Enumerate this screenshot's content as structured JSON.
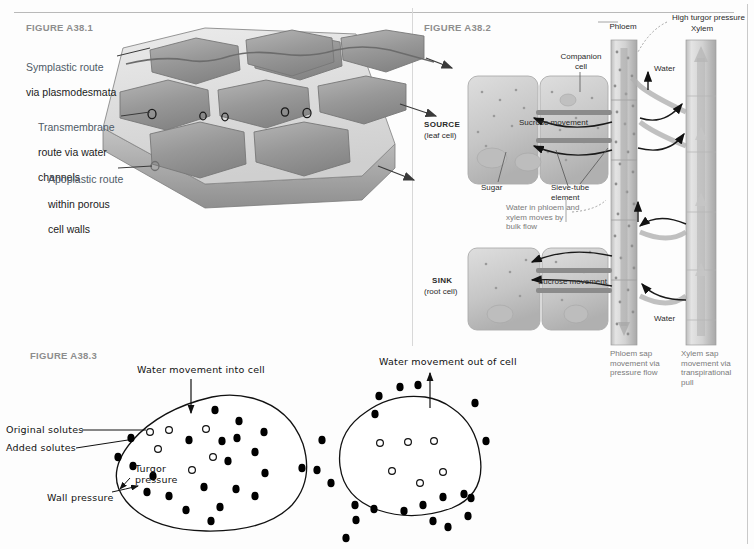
{
  "page": {
    "width": 754,
    "height": 549,
    "background": "#fdfdfd",
    "rule_color": "#b9b9b9"
  },
  "figures": {
    "fig1": {
      "label": "FIGURE A38.1",
      "topic": "Routes of water movement through plant cells",
      "callouts": [
        {
          "line1": "Symplastic route",
          "line2": "via plasmodesmata"
        },
        {
          "line1": "Transmembrane",
          "line2": "route via water",
          "line3": "channels"
        },
        {
          "line1": "Apoplastic route",
          "line2": "within porous",
          "line3": "cell walls"
        }
      ],
      "water_channel_count": 5,
      "arrow_count": 3,
      "colors": {
        "cell_fill": "#9b9b9b",
        "wall_fill": "#d8d8d8",
        "outline": "#6f6f6f"
      }
    },
    "fig2": {
      "label": "FIGURE A38.2",
      "topic": "Pressure-flow model of phloem transport",
      "labels": {
        "phloem": "Phloem",
        "xylem": "Xylem",
        "high_turgor": "High turgor pressure",
        "companion_cell": "Companion\ncell",
        "source_bold": "SOURCE",
        "source_sub": "(leaf cell)",
        "sink_bold": "SINK",
        "sink_sub": "(root cell)",
        "sucrose_top": "Sucrose movement",
        "sucrose_bottom": "Sucrose movement",
        "sugar": "Sugar",
        "sieve_tube": "Sieve-tube\nelement",
        "bulk_flow": "Water in phloem and\nxylem moves by\nbulk flow",
        "water_top": "Water",
        "water_bottom": "Water",
        "phloem_sap": "Phloem sap\nmovement via\npressure flow",
        "xylem_sap": "Xylem sap\nmovement via\ntranspirational\npull"
      },
      "colors": {
        "tube_fill": "#cfcfcf",
        "cell_fill": "#cccccc",
        "arrow_grey": "#a8a8a8",
        "arrow_black": "#1a1a1a"
      }
    },
    "fig3": {
      "label": "FIGURE A38.3",
      "topic": "Turgor pressure and water movement in a cell",
      "left_cell": {
        "title": "Water movement into cell",
        "callouts": [
          "Original solutes",
          "Added solutes",
          "Turgor\npressure",
          "Wall pressure"
        ],
        "open_solutes": 6,
        "filled_solutes_inside": 17,
        "filled_solutes_outside": 4
      },
      "right_cell": {
        "title": "Water movement out of cell",
        "open_solutes": 6,
        "filled_solutes_outside": 22
      },
      "colors": {
        "outline": "#111111",
        "solute_filled": "#000000",
        "solute_open": "#ffffff"
      }
    }
  }
}
